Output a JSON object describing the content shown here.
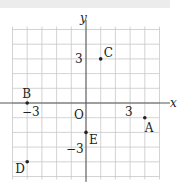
{
  "axes": {
    "x_label": "x",
    "y_label": "y",
    "origin_label": "O"
  },
  "ticks": {
    "x_pos": "3",
    "x_neg": "−3",
    "y_pos": "3",
    "y_neg": "−3"
  },
  "points": [
    {
      "name": "A",
      "x": 4,
      "y": -1
    },
    {
      "name": "B",
      "x": -4,
      "y": 0
    },
    {
      "name": "C",
      "x": 1,
      "y": 3
    },
    {
      "name": "D",
      "x": -4,
      "y": -4
    },
    {
      "name": "E",
      "x": 0,
      "y": -2
    }
  ],
  "colors": {
    "grid": "#c8c8c8",
    "axis": "#555555",
    "point": "#222222"
  }
}
